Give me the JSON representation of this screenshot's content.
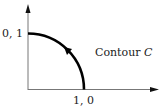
{
  "diagram": {
    "type": "contour-plot",
    "labels": {
      "y_point": "0, 1",
      "x_point": "1, 0",
      "contour_label": "Contour ",
      "contour_name": "C"
    },
    "contour": {
      "shape": "quarter-circle",
      "from": [
        1,
        0
      ],
      "to": [
        0,
        1
      ],
      "direction": "counterclockwise"
    },
    "colors": {
      "axes": "#777777",
      "contour": "#000000",
      "text": "#222222"
    }
  }
}
